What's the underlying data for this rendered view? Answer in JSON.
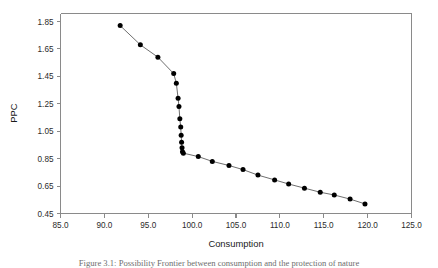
{
  "figure": {
    "caption": "Figure 3.1: Possibility Frontier between consumption and the protection of nature",
    "caption_visible_fragment": "Figure 3.1: Possibility Frontier between consumption and the protection of nature"
  },
  "chart_data": {
    "type": "line",
    "title": "",
    "xlabel": "Consumption",
    "ylabel": "PPC",
    "xlim": [
      85.0,
      125.0
    ],
    "ylim": [
      0.45,
      1.85
    ],
    "xticks": [
      85.0,
      90.0,
      95.0,
      100.0,
      105.0,
      110.0,
      115.0,
      120.0,
      125.0
    ],
    "xtick_labels": [
      "85.0",
      "90.0",
      "95.0",
      "100.0",
      "105.0",
      "110.0",
      "115.0",
      "120.0",
      "125.0"
    ],
    "yticks": [
      0.45,
      0.65,
      0.85,
      1.05,
      1.25,
      1.45,
      1.65,
      1.85
    ],
    "ytick_labels": [
      "0.45",
      "0.65",
      "0.85",
      "1.05",
      "1.25",
      "1.45",
      "1.65",
      "1.85"
    ],
    "grid": false,
    "legend": false,
    "marker": "filled-circle",
    "marker_color": "#000000",
    "line_color": "#6f6f6f",
    "series": [
      {
        "name": "PPC",
        "x": [
          91.8,
          94.1,
          96.1,
          97.9,
          98.2,
          98.4,
          98.5,
          98.6,
          98.7,
          98.75,
          98.8,
          98.85,
          98.9,
          99.0,
          100.7,
          102.3,
          104.2,
          105.8,
          107.5,
          109.4,
          111.0,
          112.8,
          114.6,
          116.2,
          118.0,
          119.7
        ],
        "y": [
          1.82,
          1.68,
          1.59,
          1.47,
          1.4,
          1.29,
          1.23,
          1.14,
          1.08,
          1.02,
          0.97,
          0.93,
          0.9,
          0.89,
          0.865,
          0.83,
          0.8,
          0.77,
          0.73,
          0.695,
          0.665,
          0.635,
          0.605,
          0.585,
          0.555,
          0.52
        ]
      }
    ]
  }
}
